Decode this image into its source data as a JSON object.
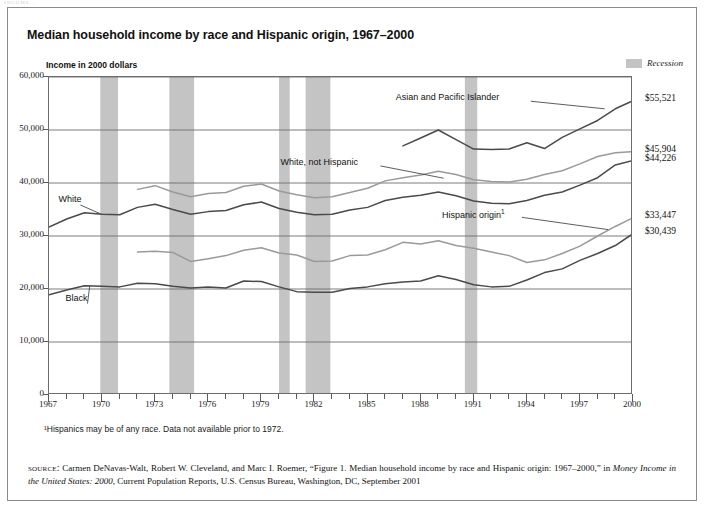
{
  "page": {
    "cropped_header": "INCOME ...",
    "title": "Median household income by race and Hispanic origin, 1967–2000",
    "axis_note": "Income in 2000 dollars",
    "legend": {
      "recession_label": "Recession",
      "recession_color": "#c4c4c4"
    },
    "footnote": "¹Hispanics may be of any race. Data not available prior to 1972.",
    "source": {
      "prefix": "source:",
      "text_part1": " Carmen DeNavas-Walt, Robert W. Cleveland, and Marc I. Roemer, “Figure 1. Median household income by race and Hispanic origin: 1967–2000,” in ",
      "italic_part": "Money Income in the United States: 2000,",
      "text_part2": " Current Population Reports, U.S. Census Bureau, Washington, DC, September 2001"
    }
  },
  "chart_data": {
    "type": "line",
    "title": "Median household income by race and Hispanic origin, 1967–2000",
    "xlabel": "",
    "ylabel": "Income in 2000 dollars",
    "xlim": [
      1967,
      2000
    ],
    "ylim": [
      0,
      60000
    ],
    "yticks": [
      0,
      10000,
      20000,
      30000,
      40000,
      50000,
      60000
    ],
    "ytick_labels": [
      "0",
      "10,000",
      "20,000",
      "30,000",
      "40,000",
      "50,000",
      "60,000"
    ],
    "xticks": [
      1967,
      1970,
      1973,
      1976,
      1979,
      1982,
      1985,
      1988,
      1991,
      1994,
      1997,
      2000
    ],
    "xtick_labels": [
      "1967",
      "1970",
      "1973",
      "1976",
      "1979",
      "1982",
      "1985",
      "1988",
      "1991",
      "1994",
      "1997",
      "2000"
    ],
    "grid": "horizontal",
    "legend_position": "inline-annotations",
    "recession_bands": [
      {
        "start": 1969.9,
        "end": 1970.9
      },
      {
        "start": 1973.8,
        "end": 1975.2
      },
      {
        "start": 1980.0,
        "end": 1980.6
      },
      {
        "start": 1981.5,
        "end": 1982.9
      },
      {
        "start": 1990.5,
        "end": 1991.2
      }
    ],
    "series": [
      {
        "name": "Asian and Pacific Islander",
        "end_value_label": "$55,521",
        "end_value": 55521,
        "x": [
          1987,
          1988,
          1989,
          1990,
          1991,
          1992,
          1993,
          1994,
          1995,
          1996,
          1997,
          1998,
          1999,
          2000
        ],
        "values": [
          47000,
          48500,
          50000,
          48200,
          46400,
          46300,
          46400,
          47600,
          46500,
          48600,
          50200,
          51800,
          54000,
          55521
        ]
      },
      {
        "name": "White, not Hispanic",
        "end_value_label": "$45,904",
        "end_value": 45904,
        "x": [
          1972,
          1973,
          1974,
          1975,
          1976,
          1977,
          1978,
          1979,
          1980,
          1981,
          1982,
          1983,
          1984,
          1985,
          1986,
          1987,
          1988,
          1989,
          1990,
          1991,
          1992,
          1993,
          1994,
          1995,
          1996,
          1997,
          1998,
          1999,
          2000
        ],
        "values": [
          38800,
          39500,
          38300,
          37400,
          38000,
          38200,
          39400,
          39800,
          38500,
          37800,
          37200,
          37400,
          38200,
          39000,
          40400,
          41000,
          41500,
          42200,
          41600,
          40600,
          40300,
          40200,
          40700,
          41600,
          42300,
          43600,
          45000,
          45700,
          45904
        ]
      },
      {
        "name": "White",
        "end_value_label": "$44,226",
        "end_value": 44226,
        "x": [
          1967,
          1968,
          1969,
          1970,
          1971,
          1972,
          1973,
          1974,
          1975,
          1976,
          1977,
          1978,
          1979,
          1980,
          1981,
          1982,
          1983,
          1984,
          1985,
          1986,
          1987,
          1988,
          1989,
          1990,
          1991,
          1992,
          1993,
          1994,
          1995,
          1996,
          1997,
          1998,
          1999,
          2000
        ],
        "values": [
          31700,
          33200,
          34400,
          34100,
          34000,
          35400,
          36000,
          35000,
          34100,
          34600,
          34800,
          35900,
          36400,
          35200,
          34500,
          34000,
          34100,
          34900,
          35400,
          36700,
          37300,
          37700,
          38300,
          37600,
          36600,
          36200,
          36100,
          36700,
          37700,
          38300,
          39600,
          41000,
          43400,
          44226
        ]
      },
      {
        "name": "Black",
        "end_value_label": "$30,439",
        "end_value": 30439,
        "x": [
          1967,
          1968,
          1969,
          1970,
          1971,
          1972,
          1973,
          1974,
          1975,
          1976,
          1977,
          1978,
          1979,
          1980,
          1981,
          1982,
          1983,
          1984,
          1985,
          1986,
          1987,
          1988,
          1989,
          1990,
          1991,
          1992,
          1993,
          1994,
          1995,
          1996,
          1997,
          1998,
          1999,
          2000
        ],
        "values": [
          18900,
          19800,
          20600,
          20500,
          20400,
          21100,
          21000,
          20500,
          20200,
          20400,
          20200,
          21500,
          21400,
          20400,
          19500,
          19400,
          19400,
          20100,
          20400,
          21000,
          21300,
          21500,
          22500,
          21800,
          20800,
          20400,
          20500,
          21700,
          23100,
          23800,
          25400,
          26700,
          28200,
          30439
        ]
      },
      {
        "name": "Hispanic origin",
        "end_value_label": "$33,447",
        "end_value": 33447,
        "note_marker": "1",
        "x": [
          1972,
          1973,
          1974,
          1975,
          1976,
          1977,
          1978,
          1979,
          1980,
          1981,
          1982,
          1983,
          1984,
          1985,
          1986,
          1987,
          1988,
          1989,
          1990,
          1991,
          1992,
          1993,
          1994,
          1995,
          1996,
          1997,
          1998,
          1999,
          2000
        ],
        "values": [
          27000,
          27100,
          26900,
          25200,
          25700,
          26300,
          27300,
          27800,
          26800,
          26400,
          25200,
          25300,
          26300,
          26400,
          27400,
          28800,
          28500,
          29100,
          28200,
          27700,
          27000,
          26300,
          25000,
          25500,
          26700,
          28100,
          30000,
          31800,
          33447
        ]
      }
    ],
    "annotations": [
      {
        "text": "Asian and Pacific Islander",
        "x": 1994.0,
        "y": 55800
      },
      {
        "text": "White, not Hispanic",
        "x": 1985.5,
        "y": 43600
      },
      {
        "text": "White",
        "x": 1969.0,
        "y": 36600
      },
      {
        "text": "Black",
        "x": 1969.4,
        "y": 18000
      },
      {
        "text": "Hispanic origin¹",
        "x": 1993.5,
        "y": 33900
      }
    ]
  }
}
